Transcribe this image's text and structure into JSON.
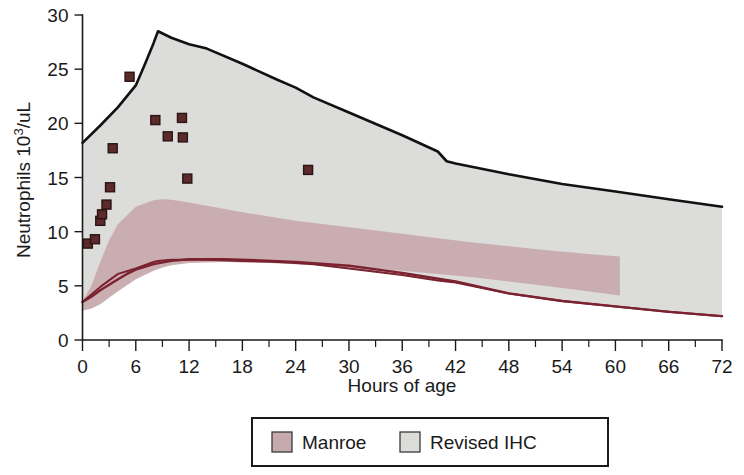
{
  "chart_data": {
    "type": "area",
    "title": "",
    "xlabel": "Hours of age",
    "ylabel": "Neutrophils 10³/uL",
    "ylabel_base": "Neutrophils 10",
    "ylabel_sup": "3",
    "ylabel_tail": "/uL",
    "xlim": [
      0,
      72
    ],
    "ylim": [
      0,
      30
    ],
    "xticks": [
      0,
      6,
      12,
      18,
      24,
      30,
      36,
      42,
      48,
      54,
      60,
      66,
      72
    ],
    "xtick_labels": [
      "0",
      "6",
      "12",
      "18",
      "24",
      "30",
      "36",
      "42",
      "48",
      "54",
      "60",
      "66",
      "72"
    ],
    "xminor_step": 3,
    "yticks": [
      0,
      5,
      10,
      15,
      20,
      25,
      30
    ],
    "ytick_labels": [
      "0",
      "5",
      "10",
      "15",
      "20",
      "25",
      "30"
    ],
    "grid": false,
    "legend_position": "bottom",
    "series": [
      {
        "name": "Revised IHC",
        "kind": "band",
        "fill": "#dcdcda",
        "stroke_upper": "#111111",
        "stroke_lower": "#7a2230",
        "x": [
          0,
          2,
          4,
          6,
          7,
          8,
          8.5,
          10,
          12,
          14,
          18,
          22,
          24,
          26,
          30,
          36,
          40,
          41,
          42,
          48,
          54,
          60,
          66,
          72
        ],
        "upper": [
          18.2,
          19.8,
          21.5,
          23.5,
          25.4,
          27.4,
          28.5,
          27.9,
          27.3,
          26.9,
          25.5,
          24.0,
          23.3,
          22.4,
          21.0,
          18.9,
          17.4,
          16.5,
          16.3,
          15.3,
          14.4,
          13.7,
          13.0,
          12.3
        ],
        "lower": [
          3.5,
          4.9,
          6.1,
          6.6,
          6.9,
          7.2,
          7.3,
          7.4,
          7.4,
          7.4,
          7.3,
          7.2,
          7.1,
          7.0,
          6.6,
          6.0,
          5.5,
          5.4,
          5.3,
          4.3,
          3.6,
          3.1,
          2.6,
          2.2
        ]
      },
      {
        "name": "Manroe",
        "kind": "band",
        "fill": "#c7aaae",
        "x_start": 0,
        "x_end": 60.5,
        "x": [
          0,
          1,
          2,
          3,
          4,
          6,
          8,
          9,
          10,
          12,
          14,
          16,
          18,
          21,
          24,
          27,
          30,
          33,
          36,
          40,
          44,
          48,
          52,
          56,
          60.5
        ],
        "upper": [
          3.6,
          5.0,
          7.2,
          9.2,
          10.7,
          12.3,
          12.9,
          13.0,
          12.95,
          12.7,
          12.4,
          12.1,
          11.8,
          11.4,
          11.0,
          10.7,
          10.4,
          10.1,
          9.8,
          9.4,
          9.0,
          8.65,
          8.3,
          8.0,
          7.7
        ],
        "lower": [
          2.7,
          2.9,
          3.3,
          3.9,
          4.5,
          5.6,
          6.4,
          6.7,
          6.9,
          7.1,
          7.15,
          7.2,
          7.15,
          7.1,
          7.0,
          6.9,
          6.75,
          6.6,
          6.4,
          6.1,
          5.8,
          5.4,
          5.0,
          4.6,
          4.1
        ]
      },
      {
        "name": "Lower reference line",
        "kind": "line",
        "stroke": "#7a2230",
        "x": [
          0,
          1,
          2,
          3,
          4,
          5,
          6,
          8,
          10,
          12,
          16,
          20,
          24,
          30,
          36,
          42,
          48,
          54,
          60,
          66,
          72
        ],
        "y": [
          3.5,
          4.0,
          4.6,
          5.1,
          5.6,
          6.1,
          6.5,
          7.0,
          7.3,
          7.45,
          7.45,
          7.35,
          7.2,
          6.85,
          6.2,
          5.4,
          4.3,
          3.6,
          3.1,
          2.6,
          2.2
        ]
      },
      {
        "name": "Patient neutrophil counts",
        "kind": "scatter",
        "marker": "square",
        "fill": "#5c2a2a",
        "stroke": "#2a1414",
        "points": [
          {
            "x": 0.6,
            "y": 8.9
          },
          {
            "x": 1.4,
            "y": 9.3
          },
          {
            "x": 2.0,
            "y": 11.0
          },
          {
            "x": 2.2,
            "y": 11.6
          },
          {
            "x": 2.7,
            "y": 12.5
          },
          {
            "x": 3.1,
            "y": 14.1
          },
          {
            "x": 3.4,
            "y": 17.7
          },
          {
            "x": 5.3,
            "y": 24.3
          },
          {
            "x": 8.2,
            "y": 20.3
          },
          {
            "x": 9.6,
            "y": 18.8
          },
          {
            "x": 11.2,
            "y": 20.5
          },
          {
            "x": 11.3,
            "y": 18.7
          },
          {
            "x": 11.8,
            "y": 14.9
          },
          {
            "x": 25.4,
            "y": 15.7
          }
        ]
      }
    ],
    "legend": [
      {
        "label": "Manroe",
        "color": "#c7aaae",
        "icon": "legend-swatch-icon"
      },
      {
        "label": "Revised IHC",
        "color": "#dcdcda",
        "icon": "legend-swatch-icon"
      }
    ]
  }
}
